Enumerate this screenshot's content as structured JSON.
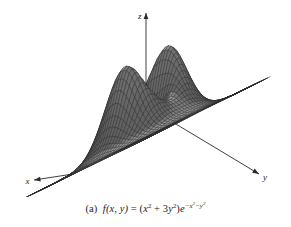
{
  "figure": {
    "kind": "3d-surface-wireframe",
    "background_color": "#ffffff",
    "mesh_color": "#2b2b2b",
    "surface_fill_light": "#e8e8e8",
    "surface_fill_dark": "#8a8a8a",
    "axis_color": "#2a2a2a",
    "axes": {
      "x_label": "x",
      "y_label": "y",
      "z_label": "z"
    }
  },
  "caption": {
    "part_label": "(a)",
    "function_name": "f",
    "args": "(x, y)",
    "equals": "=",
    "full_text": "(a) f(x, y) = (x² + 3y²)e⁻ˣ²⁻ʸ²",
    "expression_plain": "(x^2 + 3y^2)e^(-x^2-y^2)",
    "terms": {
      "x_var": "x",
      "y_var": "y",
      "coef_y": "3",
      "exp_two": "2",
      "e_base": "e",
      "minus": "−"
    }
  },
  "chart_data": {
    "type": "surface",
    "title": "",
    "subtitle": "",
    "function": "f(x, y) = (x^2 + 3y^2) * exp(-x^2 - y^2)",
    "xlabel": "x",
    "ylabel": "y",
    "zlabel": "z",
    "xlim": [
      -3,
      3
    ],
    "ylim": [
      -3,
      3
    ],
    "zlim": [
      0,
      1.2
    ],
    "grid": true,
    "legend": "none",
    "mesh_samples_x": 46,
    "mesh_samples_y": 46,
    "peaks": [
      {
        "x": 0,
        "y": 1,
        "z": 1.1036,
        "label": "left-peak"
      },
      {
        "x": 0,
        "y": -1,
        "z": 1.1036,
        "label": "right-peak"
      }
    ],
    "minimum": {
      "x": 0,
      "y": 0,
      "z": 0
    },
    "annotations": [],
    "projection": {
      "type": "axonometric",
      "azimuth_deg": 45,
      "elevation_deg": 28
    }
  }
}
